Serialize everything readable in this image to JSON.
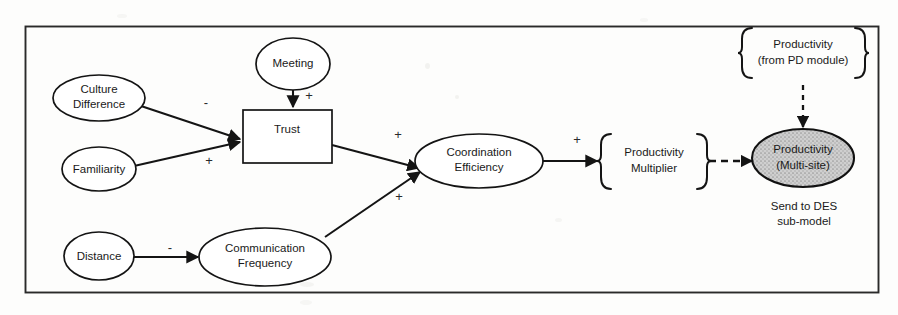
{
  "diagram": {
    "nodes": {
      "culture_difference": "Culture\nDifference",
      "culture_difference_line1": "Culture",
      "culture_difference_line2": "Difference",
      "familiarity": "Familiarity",
      "meeting": "Meeting",
      "trust": "Trust",
      "distance": "Distance",
      "communication_frequency_line1": "Communication",
      "communication_frequency_line2": "Frequency",
      "coordination_efficiency_line1": "Coordination",
      "coordination_efficiency_line2": "Efficiency",
      "productivity_multiplier_line1": "Productivity",
      "productivity_multiplier_line2": "Multiplier",
      "productivity_multisite_line1": "Productivity",
      "productivity_multisite_line2": "(Multi-site)",
      "productivity_pd_line1": "Productivity",
      "productivity_pd_line2": "(from PD module)"
    },
    "annotations": {
      "send_to_des_line1": "Send to DES",
      "send_to_des_line2": "sub-model"
    },
    "edge_signs": {
      "culture_to_trust": "-",
      "familiarity_to_trust": "+",
      "meeting_to_trust": "+",
      "trust_to_coordination": "+",
      "communication_to_coordination": "+",
      "coordination_to_multiplier": "+",
      "distance_to_communication": "-"
    },
    "colors": {
      "stroke": "#141414",
      "frame": "#2a2a2a",
      "node_fill": "#ffffff",
      "shaded_fill": "#c9c9c9",
      "background": "#fdfdfc",
      "text": "#1a1a1a"
    }
  }
}
